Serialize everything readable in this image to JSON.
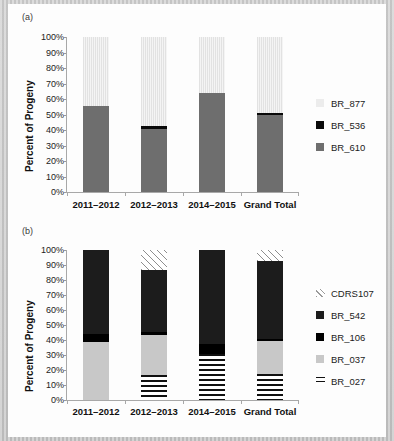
{
  "figure": {
    "panel_a_tag": "(a)",
    "panel_b_tag": "(b)",
    "ylabel": "Percent of Progeny"
  },
  "axis": {
    "ticks": [
      "100%",
      "90%",
      "80%",
      "70%",
      "60%",
      "50%",
      "40%",
      "30%",
      "20%",
      "10%",
      "0%"
    ]
  },
  "chart_data": [
    {
      "type": "bar",
      "panel": "(a)",
      "stacked": true,
      "stack_mode": "percent",
      "title": "",
      "xlabel": "",
      "ylabel": "Percent of Progeny",
      "ylim": [
        0,
        100
      ],
      "ytick_labels": [
        "0%",
        "10%",
        "20%",
        "30%",
        "40%",
        "50%",
        "60%",
        "70%",
        "80%",
        "90%",
        "100%"
      ],
      "grid": false,
      "legend_position": "right",
      "categories": [
        "2011–2012",
        "2012–2013",
        "2014–2015",
        "Grand Total"
      ],
      "series": [
        {
          "name": "BR_610",
          "color": "#6e6e6e",
          "values": [
            55.7,
            40.5,
            63.9,
            49.5
          ]
        },
        {
          "name": "BR_536",
          "color": "#0a0a0a",
          "values": [
            0.0,
            2.0,
            0.0,
            1.5
          ]
        },
        {
          "name": "BR_877",
          "color": "#ececec",
          "values": [
            44.3,
            57.5,
            36.1,
            49.0
          ]
        }
      ],
      "legend_order": [
        "BR_877",
        "BR_536",
        "BR_610"
      ]
    },
    {
      "type": "bar",
      "panel": "(b)",
      "stacked": true,
      "stack_mode": "percent",
      "title": "",
      "xlabel": "",
      "ylabel": "Percent of Progeny",
      "ylim": [
        0,
        100
      ],
      "ytick_labels": [
        "0%",
        "10%",
        "20%",
        "30%",
        "40%",
        "50%",
        "60%",
        "70%",
        "80%",
        "90%",
        "100%"
      ],
      "grid": false,
      "legend_position": "right",
      "categories": [
        "2011–2012",
        "2012–2013",
        "2014–2015",
        "Grand Total"
      ],
      "series": [
        {
          "name": "BR_027",
          "color": "#101010",
          "values": [
            0.0,
            16.5,
            30.5,
            17.5
          ]
        },
        {
          "name": "BR_037",
          "color": "#c8c8c8",
          "values": [
            38.5,
            27.0,
            0.0,
            22.0
          ]
        },
        {
          "name": "BR_106",
          "color": "#000000",
          "values": [
            5.5,
            2.0,
            7.0,
            1.0
          ]
        },
        {
          "name": "BR_542",
          "color": "#1c1c1c",
          "values": [
            56.0,
            41.5,
            62.5,
            52.5
          ]
        },
        {
          "name": "CDRS107",
          "color": "#9a9a9a",
          "values": [
            0.0,
            13.0,
            0.0,
            7.0
          ]
        }
      ],
      "legend_order": [
        "CDRS107",
        "BR_542",
        "BR_106",
        "BR_037",
        "BR_027"
      ]
    }
  ]
}
